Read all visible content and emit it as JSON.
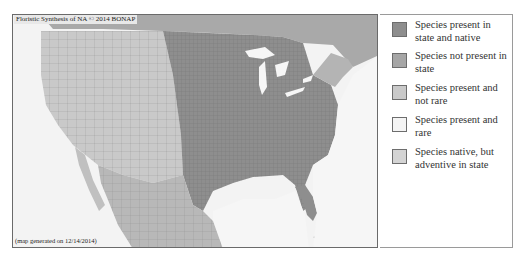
{
  "map": {
    "title": "Floristic Synthesis of NA © 2014 BONAP",
    "footer": "(map generated on 12/14/2014)",
    "colors": {
      "background": "#f3f3f3",
      "native": "#8e8e8e",
      "not_present": "#a6a6a6",
      "not_rare": "#c9c9c9",
      "rare": "#f4f4f4",
      "adventive": "#d4d4d4",
      "water": "#f6f6f6",
      "county_lines": "#6f6f6f"
    }
  },
  "legend": {
    "items": [
      {
        "label": "Species present in state and native",
        "color": "#8e8e8e"
      },
      {
        "label": "Species not present in state",
        "color": "#a6a6a6"
      },
      {
        "label": "Species present and not rare",
        "color": "#c9c9c9"
      },
      {
        "label": "Species present and rare",
        "color": "#f4f4f4"
      },
      {
        "label": "Species native, but adventive in state",
        "color": "#d4d4d4"
      }
    ]
  }
}
